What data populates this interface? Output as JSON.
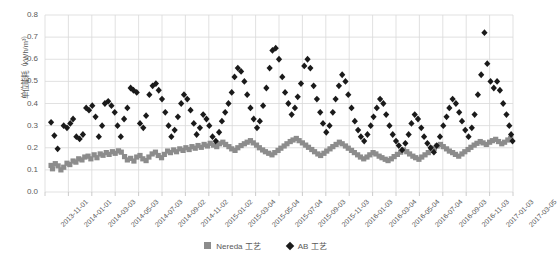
{
  "chart_data": {
    "type": "scatter",
    "title": "",
    "xlabel": "",
    "ylabel": "单位能耗（kWh/m³）",
    "ylim": [
      0.0,
      0.8
    ],
    "ytick_labels": [
      "0.0",
      "0.1",
      "0.2",
      "0.3",
      "0.4",
      "0.5",
      "0.6",
      "0.7",
      "0.8"
    ],
    "ytick_values": [
      0.0,
      0.1,
      0.2,
      0.3,
      0.4,
      0.5,
      0.6,
      0.7,
      0.8
    ],
    "xtick_labels": [
      "2013-11-01",
      "2014-01-01",
      "2014-03-03",
      "2014-05-03",
      "2014-07-03",
      "2014-09-02",
      "2014-11-02",
      "2015-01-02",
      "2015-03-04",
      "2015-05-04",
      "2015-07-04",
      "2015-09-03",
      "2015-11-03",
      "2016-01-03",
      "2016-03-04",
      "2016-05-04",
      "2016-07-04",
      "2016-09-03",
      "2016-11-03",
      "2017-01-03",
      "2017-03-05"
    ],
    "xlim": [
      "2013-11-01",
      "2017-03-05"
    ],
    "grid": true,
    "legend_position": "bottom-center",
    "colors": {
      "nereda": "#8c8c8c",
      "ab": "#1a1a1a",
      "grid": "#d9d9d9",
      "text": "#595959"
    },
    "series": [
      {
        "name": "Nereda 工艺",
        "marker": "square",
        "color": "#8c8c8c",
        "points": [
          [
            0.013,
            0.12
          ],
          [
            0.016,
            0.105
          ],
          [
            0.022,
            0.128
          ],
          [
            0.028,
            0.118
          ],
          [
            0.034,
            0.1
          ],
          [
            0.04,
            0.112
          ],
          [
            0.047,
            0.13
          ],
          [
            0.053,
            0.124
          ],
          [
            0.06,
            0.14
          ],
          [
            0.066,
            0.135
          ],
          [
            0.072,
            0.15
          ],
          [
            0.079,
            0.145
          ],
          [
            0.085,
            0.158
          ],
          [
            0.092,
            0.162
          ],
          [
            0.098,
            0.15
          ],
          [
            0.105,
            0.168
          ],
          [
            0.111,
            0.155
          ],
          [
            0.118,
            0.172
          ],
          [
            0.124,
            0.166
          ],
          [
            0.131,
            0.178
          ],
          [
            0.137,
            0.17
          ],
          [
            0.144,
            0.182
          ],
          [
            0.15,
            0.175
          ],
          [
            0.157,
            0.186
          ],
          [
            0.163,
            0.18
          ],
          [
            0.17,
            0.16
          ],
          [
            0.176,
            0.145
          ],
          [
            0.183,
            0.152
          ],
          [
            0.19,
            0.14
          ],
          [
            0.196,
            0.158
          ],
          [
            0.203,
            0.165
          ],
          [
            0.209,
            0.15
          ],
          [
            0.216,
            0.142
          ],
          [
            0.222,
            0.158
          ],
          [
            0.229,
            0.172
          ],
          [
            0.236,
            0.18
          ],
          [
            0.242,
            0.165
          ],
          [
            0.249,
            0.155
          ],
          [
            0.255,
            0.17
          ],
          [
            0.262,
            0.185
          ],
          [
            0.268,
            0.178
          ],
          [
            0.275,
            0.19
          ],
          [
            0.281,
            0.182
          ],
          [
            0.288,
            0.195
          ],
          [
            0.295,
            0.188
          ],
          [
            0.301,
            0.2
          ],
          [
            0.308,
            0.192
          ],
          [
            0.314,
            0.205
          ],
          [
            0.321,
            0.198
          ],
          [
            0.327,
            0.21
          ],
          [
            0.334,
            0.202
          ],
          [
            0.34,
            0.215
          ],
          [
            0.347,
            0.208
          ],
          [
            0.353,
            0.22
          ],
          [
            0.36,
            0.212
          ],
          [
            0.367,
            0.205
          ],
          [
            0.373,
            0.218
          ],
          [
            0.38,
            0.225
          ],
          [
            0.386,
            0.215
          ],
          [
            0.393,
            0.205
          ],
          [
            0.399,
            0.195
          ],
          [
            0.406,
            0.188
          ],
          [
            0.412,
            0.2
          ],
          [
            0.419,
            0.21
          ],
          [
            0.426,
            0.218
          ],
          [
            0.432,
            0.225
          ],
          [
            0.439,
            0.232
          ],
          [
            0.445,
            0.222
          ],
          [
            0.452,
            0.212
          ],
          [
            0.458,
            0.2
          ],
          [
            0.465,
            0.19
          ],
          [
            0.471,
            0.182
          ],
          [
            0.478,
            0.175
          ],
          [
            0.485,
            0.168
          ],
          [
            0.491,
            0.178
          ],
          [
            0.498,
            0.188
          ],
          [
            0.504,
            0.198
          ],
          [
            0.511,
            0.208
          ],
          [
            0.517,
            0.218
          ],
          [
            0.524,
            0.228
          ],
          [
            0.53,
            0.235
          ],
          [
            0.537,
            0.242
          ],
          [
            0.543,
            0.232
          ],
          [
            0.55,
            0.222
          ],
          [
            0.557,
            0.212
          ],
          [
            0.563,
            0.202
          ],
          [
            0.57,
            0.192
          ],
          [
            0.576,
            0.182
          ],
          [
            0.583,
            0.172
          ],
          [
            0.589,
            0.165
          ],
          [
            0.596,
            0.175
          ],
          [
            0.602,
            0.185
          ],
          [
            0.609,
            0.195
          ],
          [
            0.615,
            0.205
          ],
          [
            0.622,
            0.215
          ],
          [
            0.629,
            0.225
          ],
          [
            0.635,
            0.218
          ],
          [
            0.642,
            0.208
          ],
          [
            0.648,
            0.198
          ],
          [
            0.655,
            0.188
          ],
          [
            0.661,
            0.178
          ],
          [
            0.668,
            0.168
          ],
          [
            0.674,
            0.158
          ],
          [
            0.681,
            0.15
          ],
          [
            0.688,
            0.158
          ],
          [
            0.694,
            0.168
          ],
          [
            0.701,
            0.178
          ],
          [
            0.707,
            0.172
          ],
          [
            0.714,
            0.162
          ],
          [
            0.72,
            0.155
          ],
          [
            0.727,
            0.148
          ],
          [
            0.733,
            0.142
          ],
          [
            0.74,
            0.15
          ],
          [
            0.746,
            0.16
          ],
          [
            0.753,
            0.17
          ],
          [
            0.76,
            0.18
          ],
          [
            0.766,
            0.19
          ],
          [
            0.773,
            0.182
          ],
          [
            0.779,
            0.172
          ],
          [
            0.786,
            0.162
          ],
          [
            0.792,
            0.155
          ],
          [
            0.799,
            0.148
          ],
          [
            0.805,
            0.158
          ],
          [
            0.812,
            0.168
          ],
          [
            0.819,
            0.178
          ],
          [
            0.825,
            0.188
          ],
          [
            0.832,
            0.198
          ],
          [
            0.838,
            0.208
          ],
          [
            0.845,
            0.215
          ],
          [
            0.851,
            0.205
          ],
          [
            0.858,
            0.195
          ],
          [
            0.864,
            0.185
          ],
          [
            0.871,
            0.178
          ],
          [
            0.877,
            0.17
          ],
          [
            0.884,
            0.162
          ],
          [
            0.891,
            0.172
          ],
          [
            0.897,
            0.182
          ],
          [
            0.904,
            0.192
          ],
          [
            0.91,
            0.202
          ],
          [
            0.917,
            0.212
          ],
          [
            0.923,
            0.22
          ],
          [
            0.93,
            0.228
          ],
          [
            0.936,
            0.222
          ],
          [
            0.943,
            0.215
          ],
          [
            0.95,
            0.225
          ],
          [
            0.956,
            0.232
          ],
          [
            0.963,
            0.238
          ],
          [
            0.969,
            0.228
          ],
          [
            0.976,
            0.218
          ],
          [
            0.982,
            0.225
          ],
          [
            0.989,
            0.235
          ],
          [
            0.995,
            0.242
          ]
        ]
      },
      {
        "name": "AB 工艺",
        "marker": "diamond",
        "color": "#1a1a1a",
        "points": [
          [
            0.013,
            0.315
          ],
          [
            0.02,
            0.255
          ],
          [
            0.027,
            0.195
          ],
          [
            0.04,
            0.3
          ],
          [
            0.047,
            0.29
          ],
          [
            0.054,
            0.31
          ],
          [
            0.06,
            0.33
          ],
          [
            0.067,
            0.25
          ],
          [
            0.074,
            0.24
          ],
          [
            0.081,
            0.26
          ],
          [
            0.088,
            0.38
          ],
          [
            0.094,
            0.37
          ],
          [
            0.101,
            0.39
          ],
          [
            0.108,
            0.34
          ],
          [
            0.115,
            0.25
          ],
          [
            0.122,
            0.3
          ],
          [
            0.128,
            0.4
          ],
          [
            0.135,
            0.41
          ],
          [
            0.142,
            0.39
          ],
          [
            0.149,
            0.36
          ],
          [
            0.155,
            0.3
          ],
          [
            0.162,
            0.25
          ],
          [
            0.169,
            0.33
          ],
          [
            0.176,
            0.38
          ],
          [
            0.183,
            0.47
          ],
          [
            0.189,
            0.46
          ],
          [
            0.196,
            0.45
          ],
          [
            0.203,
            0.31
          ],
          [
            0.21,
            0.29
          ],
          [
            0.216,
            0.345
          ],
          [
            0.223,
            0.44
          ],
          [
            0.23,
            0.48
          ],
          [
            0.237,
            0.49
          ],
          [
            0.243,
            0.46
          ],
          [
            0.25,
            0.42
          ],
          [
            0.257,
            0.36
          ],
          [
            0.264,
            0.3
          ],
          [
            0.27,
            0.25
          ],
          [
            0.277,
            0.28
          ],
          [
            0.284,
            0.34
          ],
          [
            0.291,
            0.4
          ],
          [
            0.297,
            0.44
          ],
          [
            0.304,
            0.42
          ],
          [
            0.311,
            0.37
          ],
          [
            0.318,
            0.31
          ],
          [
            0.324,
            0.26
          ],
          [
            0.331,
            0.29
          ],
          [
            0.338,
            0.35
          ],
          [
            0.345,
            0.33
          ],
          [
            0.351,
            0.3
          ],
          [
            0.358,
            0.25
          ],
          [
            0.365,
            0.23
          ],
          [
            0.372,
            0.27
          ],
          [
            0.378,
            0.32
          ],
          [
            0.385,
            0.36
          ],
          [
            0.392,
            0.4
          ],
          [
            0.399,
            0.45
          ],
          [
            0.405,
            0.52
          ],
          [
            0.412,
            0.56
          ],
          [
            0.419,
            0.545
          ],
          [
            0.426,
            0.5
          ],
          [
            0.432,
            0.44
          ],
          [
            0.439,
            0.38
          ],
          [
            0.446,
            0.33
          ],
          [
            0.453,
            0.29
          ],
          [
            0.459,
            0.32
          ],
          [
            0.466,
            0.39
          ],
          [
            0.473,
            0.47
          ],
          [
            0.48,
            0.56
          ],
          [
            0.486,
            0.64
          ],
          [
            0.493,
            0.65
          ],
          [
            0.5,
            0.6
          ],
          [
            0.507,
            0.52
          ],
          [
            0.513,
            0.45
          ],
          [
            0.52,
            0.4
          ],
          [
            0.527,
            0.35
          ],
          [
            0.534,
            0.38
          ],
          [
            0.54,
            0.43
          ],
          [
            0.547,
            0.49
          ],
          [
            0.554,
            0.57
          ],
          [
            0.561,
            0.6
          ],
          [
            0.567,
            0.56
          ],
          [
            0.574,
            0.48
          ],
          [
            0.581,
            0.42
          ],
          [
            0.588,
            0.36
          ],
          [
            0.594,
            0.31
          ],
          [
            0.601,
            0.27
          ],
          [
            0.608,
            0.3
          ],
          [
            0.615,
            0.36
          ],
          [
            0.621,
            0.42
          ],
          [
            0.628,
            0.48
          ],
          [
            0.635,
            0.53
          ],
          [
            0.642,
            0.5
          ],
          [
            0.648,
            0.44
          ],
          [
            0.655,
            0.38
          ],
          [
            0.662,
            0.32
          ],
          [
            0.669,
            0.28
          ],
          [
            0.675,
            0.25
          ],
          [
            0.682,
            0.23
          ],
          [
            0.689,
            0.26
          ],
          [
            0.696,
            0.3
          ],
          [
            0.702,
            0.34
          ],
          [
            0.709,
            0.38
          ],
          [
            0.716,
            0.42
          ],
          [
            0.723,
            0.4
          ],
          [
            0.729,
            0.35
          ],
          [
            0.736,
            0.3
          ],
          [
            0.743,
            0.26
          ],
          [
            0.75,
            0.23
          ],
          [
            0.756,
            0.21
          ],
          [
            0.763,
            0.19
          ],
          [
            0.77,
            0.22
          ],
          [
            0.777,
            0.26
          ],
          [
            0.783,
            0.31
          ],
          [
            0.79,
            0.35
          ],
          [
            0.797,
            0.33
          ],
          [
            0.804,
            0.29
          ],
          [
            0.81,
            0.25
          ],
          [
            0.817,
            0.22
          ],
          [
            0.824,
            0.2
          ],
          [
            0.831,
            0.18
          ],
          [
            0.837,
            0.21
          ],
          [
            0.844,
            0.25
          ],
          [
            0.851,
            0.3
          ],
          [
            0.858,
            0.34
          ],
          [
            0.864,
            0.38
          ],
          [
            0.871,
            0.42
          ],
          [
            0.878,
            0.4
          ],
          [
            0.885,
            0.36
          ],
          [
            0.891,
            0.32
          ],
          [
            0.898,
            0.28
          ],
          [
            0.905,
            0.25
          ],
          [
            0.912,
            0.29
          ],
          [
            0.918,
            0.35
          ],
          [
            0.925,
            0.44
          ],
          [
            0.932,
            0.53
          ],
          [
            0.939,
            0.72
          ],
          [
            0.945,
            0.58
          ],
          [
            0.952,
            0.5
          ],
          [
            0.959,
            0.47
          ],
          [
            0.966,
            0.5
          ],
          [
            0.972,
            0.46
          ],
          [
            0.979,
            0.4
          ],
          [
            0.986,
            0.35
          ],
          [
            0.992,
            0.3
          ],
          [
            0.996,
            0.26
          ],
          [
            0.999,
            0.23
          ]
        ]
      }
    ],
    "legend": [
      {
        "label": "Nereda 工艺",
        "marker": "square",
        "color": "#8c8c8c"
      },
      {
        "label": "AB 工艺",
        "marker": "diamond",
        "color": "#1a1a1a"
      }
    ]
  }
}
